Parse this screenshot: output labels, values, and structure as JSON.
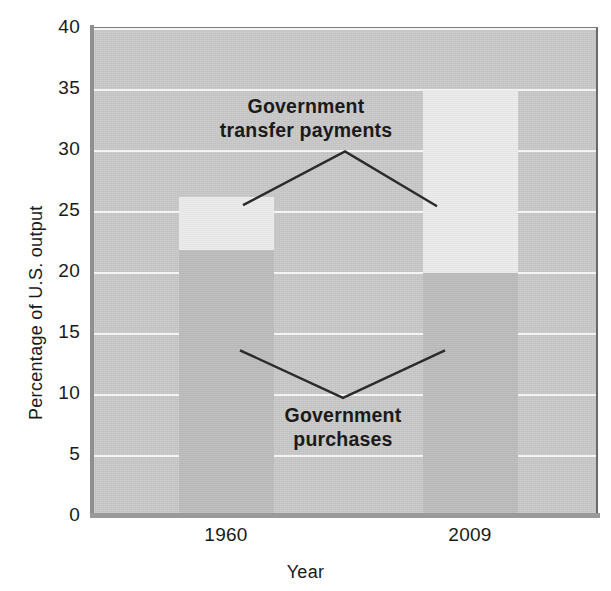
{
  "chart_data": {
    "type": "bar",
    "title": "",
    "subtitle": "",
    "xlabel": "Year",
    "ylabel": "Percentage of U.S. output",
    "categories": [
      "1960",
      "2009"
    ],
    "ylim": [
      0,
      40
    ],
    "yticks": [
      0,
      5,
      10,
      15,
      20,
      25,
      30,
      35,
      40
    ],
    "grid": true,
    "legend": "none (series labeled by in-plot annotations)",
    "stacked": true,
    "series": [
      {
        "name": "Government purchases",
        "values": [
          21.9,
          20.0
        ],
        "color": "#bdbdbd"
      },
      {
        "name": "Government transfer payments",
        "values": [
          4.3,
          15.0
        ],
        "color": "#e8e8e8"
      }
    ],
    "stack_tops": [
      26.2,
      35.0
    ],
    "annotations": [
      {
        "text": "Government\ntransfer payments",
        "label_line1": "Government",
        "label_line2": "transfer payments",
        "leader_shape": "inverted-v",
        "leader_apex_value": 29.8,
        "leader_left_value": 25.4,
        "leader_right_value": 25.3
      },
      {
        "text": "Government\npurchases",
        "label_line1": "Government",
        "label_line2": "purchases",
        "leader_shape": "v",
        "leader_vertex_value": 9.6,
        "leader_left_value": 13.5,
        "leader_right_value": 13.5
      }
    ],
    "colors": {
      "plot_background": "#c8c8c8",
      "gridline": "#f4f4f4",
      "purchases": "#bdbdbd",
      "transfers": "#e8e8e8",
      "axis": "#8f8f8f",
      "text": "#1a1a1a",
      "leader_line": "#2b2b2b"
    }
  },
  "axes": {
    "y_title": "Percentage of U.S. output",
    "x_title": "Year",
    "y_tick_labels": [
      "40",
      "35",
      "30",
      "25",
      "20",
      "15",
      "10",
      "5",
      "0"
    ],
    "x_tick_labels": [
      "1960",
      "2009"
    ]
  }
}
